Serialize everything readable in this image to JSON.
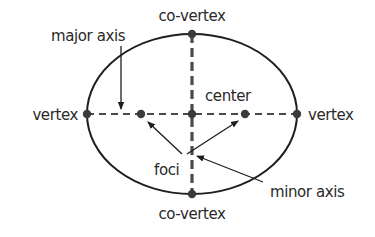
{
  "diagram": {
    "colors": {
      "stroke": "#1e1e1e",
      "point": "#3a3a3a",
      "text": "#2a2a2a",
      "background": "#ffffff"
    },
    "ellipse": {
      "cx": 192,
      "cy": 114,
      "rx": 105,
      "ry": 80
    },
    "points": {
      "center": {
        "x": 192,
        "y": 114
      },
      "vertex_left": {
        "x": 87,
        "y": 114
      },
      "vertex_right": {
        "x": 297,
        "y": 114
      },
      "covertex_top": {
        "x": 192,
        "y": 34
      },
      "covertex_bottom": {
        "x": 192,
        "y": 194
      },
      "focus_left": {
        "x": 141,
        "y": 114
      },
      "focus_right": {
        "x": 245,
        "y": 114
      }
    },
    "labels": {
      "covertex_top": "co-vertex",
      "covertex_bottom": "co-vertex",
      "vertex_left": "vertex",
      "vertex_right": "vertex",
      "major_axis": "major axis",
      "minor_axis": "minor axis",
      "center": "center",
      "foci": "foci"
    }
  }
}
